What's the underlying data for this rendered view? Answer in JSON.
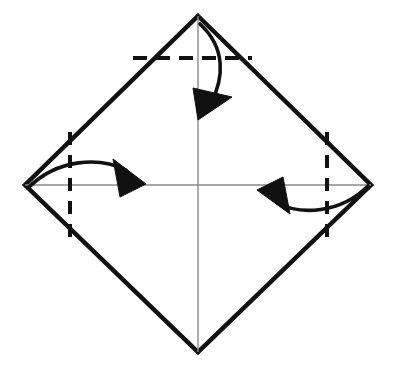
{
  "figure": {
    "background_color": "#ffffff",
    "canvas": {
      "width": 395,
      "height": 369
    }
  },
  "colors": {
    "outline": "#111111",
    "crease_line": "#8a8a8a",
    "fold_line": "#111111",
    "arrow": "#111111",
    "paper_fill": "#ffffff"
  },
  "shapes": {
    "diamond": {
      "name": "paper-square-rotated",
      "stroke_width": 4.5,
      "vertices": [
        {
          "label": "top",
          "x": 198,
          "y": 16
        },
        {
          "label": "right",
          "x": 371,
          "y": 185
        },
        {
          "label": "bottom",
          "x": 198,
          "y": 352
        },
        {
          "label": "left",
          "x": 25,
          "y": 185
        }
      ]
    },
    "crease_lines": [
      {
        "name": "vertical-diagonal-crease",
        "orientation": "vertical",
        "stroke_width": 1.4,
        "x1": 198,
        "y1": 16,
        "x2": 198,
        "y2": 352
      },
      {
        "name": "horizontal-diagonal-crease",
        "orientation": "horizontal",
        "stroke_width": 1.4,
        "x1": 25,
        "y1": 185,
        "x2": 371,
        "y2": 185
      }
    ],
    "fold_lines": [
      {
        "name": "top-dashed-fold-line",
        "orientation": "horizontal",
        "stroke_width": 4,
        "dash": "14 9",
        "x1": 133,
        "y1": 58,
        "x2": 252,
        "y2": 58
      },
      {
        "name": "left-dashed-fold-line",
        "orientation": "vertical",
        "stroke_width": 4,
        "dash": "13 10",
        "x1": 70,
        "y1": 132,
        "x2": 70,
        "y2": 243
      },
      {
        "name": "right-dashed-fold-line",
        "orientation": "vertical",
        "stroke_width": 4,
        "dash": "13 10",
        "x1": 327,
        "y1": 132,
        "x2": 327,
        "y2": 243
      }
    ],
    "arrows": [
      {
        "name": "top-fold-arrow",
        "direction": "down",
        "stroke_width": 3.6,
        "path": "M 200 24 C 226 48, 224 78, 211 103",
        "head": "M 198 120 L 193 88 L 232 97 Z"
      },
      {
        "name": "left-fold-arrow",
        "direction": "right",
        "stroke_width": 3.6,
        "path": "M 28 188 C 58 158, 100 157, 126 170",
        "head": "M 146 184 L 113 159 L 120 197 Z"
      },
      {
        "name": "right-fold-arrow",
        "direction": "left",
        "stroke_width": 3.6,
        "path": "M 368 186 C 340 214, 300 215, 277 203",
        "head": "M 257 190 L 290 214 L 283 177 Z"
      }
    ]
  },
  "labels": {
    "none": ""
  }
}
